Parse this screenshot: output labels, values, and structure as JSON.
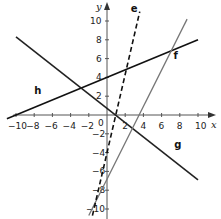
{
  "chart_data": {
    "type": "line",
    "title": "",
    "xlabel": "x",
    "ylabel": "y",
    "xlim": [
      -10,
      10
    ],
    "ylim": [
      -10,
      10
    ],
    "grid": false,
    "x_ticks": [
      -10,
      -8,
      -6,
      -4,
      -2,
      2,
      4,
      6,
      8,
      10
    ],
    "y_ticks": [
      10,
      8,
      6,
      4,
      2,
      -2,
      -4,
      -6,
      -8,
      -10
    ],
    "origin_label": "0",
    "series": [
      {
        "name": "h",
        "equation": "y = 0.4x + 4",
        "style": "solid",
        "color": "#111111",
        "x": [
          -11,
          10
        ],
        "y": [
          -0.4,
          8
        ]
      },
      {
        "name": "g",
        "equation": "y = -0.75x + 1",
        "style": "solid",
        "color": "#222222",
        "x": [
          -10,
          10
        ],
        "y": [
          8.3,
          -6.9
        ]
      },
      {
        "name": "f",
        "equation": "y = 2x - 7",
        "style": "solid",
        "color": "#777777",
        "x": [
          -2,
          8.8
        ],
        "y": [
          -10.7,
          10.2
        ]
      },
      {
        "name": "e",
        "equation": "y = 4x - 4",
        "style": "dashed",
        "color": "#111111",
        "x": [
          -1.6,
          3.6
        ],
        "y": [
          -10.7,
          11
        ]
      }
    ],
    "annotations": [
      {
        "text": "h",
        "at": [
          -8,
          2.2
        ]
      },
      {
        "text": "g",
        "at": [
          7.4,
          -3.5
        ]
      },
      {
        "text": "f",
        "at": [
          7.3,
          6.0
        ]
      },
      {
        "text": "e",
        "at": [
          2.6,
          11
        ]
      }
    ]
  }
}
